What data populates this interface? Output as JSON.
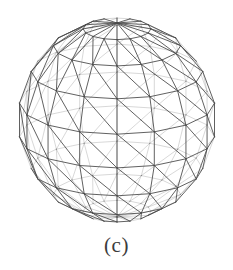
{
  "figure": {
    "caption": "(c)",
    "render_style": "wireframe",
    "hidden_line_removal": "false",
    "line_color": "#4a4a4a",
    "background_color": "#ffffff",
    "geometry": {
      "type": "uv-sphere",
      "meridians": 16,
      "latitude_bands": 9,
      "triangulation": "each quad split by a diagonal from lower-left to upper-right",
      "center_x": 117,
      "center_y": 120,
      "radius_x": 99,
      "radius_y": 102,
      "view_elevation_deg": 18,
      "top_pole_visible": "true",
      "bottom_pole_visible": "false"
    }
  }
}
